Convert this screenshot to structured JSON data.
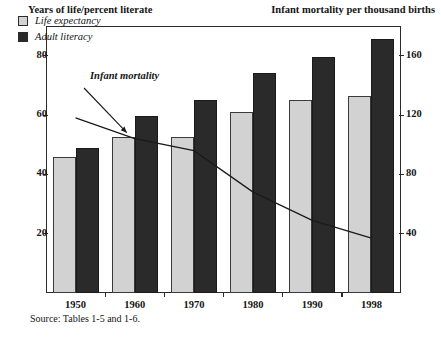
{
  "axis_titles": {
    "left": "Years of life/percent literate",
    "right": "Infant mortality per thousand births"
  },
  "legend": {
    "items": [
      {
        "label": "Life expectancy",
        "color": "#d2d2d2",
        "swatch": "light-swatch"
      },
      {
        "label": "Adult literacy",
        "color": "#2a2a2a",
        "swatch": "dark-swatch"
      }
    ]
  },
  "annotation": {
    "label": "Infant mortality"
  },
  "source": "Source: Tables 1-5 and 1-6.",
  "chart_data": {
    "type": "bar",
    "title": "",
    "subtitle": "",
    "categories": [
      "1950",
      "1960",
      "1970",
      "1980",
      "1990",
      "1998"
    ],
    "xlabel": "",
    "ylabel": "Years of life/percent literate",
    "ylabel_right": "Infant mortality per thousand births",
    "ylim": [
      0,
      90
    ],
    "ylim_right": [
      0,
      180
    ],
    "yticks": [
      20,
      40,
      60,
      80
    ],
    "yticks_right": [
      40,
      80,
      120,
      160
    ],
    "grid": false,
    "legend_position": "top-left-inside",
    "series": [
      {
        "name": "Life expectancy",
        "type": "bar",
        "axis": "left",
        "color": "#d2d2d2",
        "values": [
          46,
          52.5,
          52.5,
          61,
          65,
          66.5
        ]
      },
      {
        "name": "Adult literacy",
        "type": "bar",
        "axis": "left",
        "color": "#2a2a2a",
        "values": [
          49,
          59.5,
          65,
          74,
          79.5,
          85.5
        ]
      },
      {
        "name": "Infant mortality",
        "type": "line",
        "axis": "right",
        "color": "#1a1a1a",
        "values": [
          118,
          104,
          96,
          68,
          49,
          37
        ]
      }
    ],
    "annotations": [
      {
        "text": "Infant mortality",
        "points_to_series": "Infant mortality",
        "points_to_x": "1960"
      }
    ]
  }
}
